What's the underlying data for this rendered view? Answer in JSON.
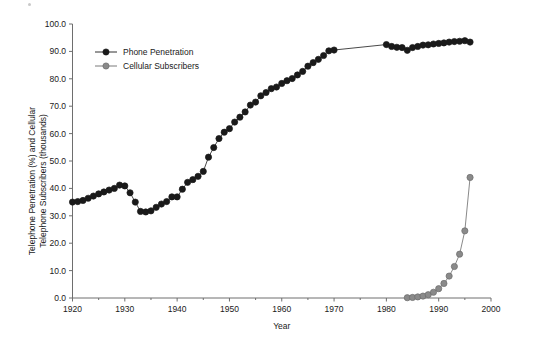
{
  "figure": {
    "background": "#ffffff",
    "axis_color": "#6e6e6e",
    "text_color": "#1a1a1a"
  },
  "chart_data": {
    "type": "line",
    "title": "",
    "xlabel": "Year",
    "ylabel": "Telephone Penetration (%) and Cellular Telephone Subscribers (thousands)",
    "ylabel_line1": "Telephone Penetration (%) and Cellular",
    "ylabel_line2": "Telephone Subscribers (thousands)",
    "xlim": [
      1920,
      2000
    ],
    "ylim": [
      0,
      100
    ],
    "x_major_ticks": [
      1920,
      1930,
      1940,
      1950,
      1960,
      1970,
      1980,
      1990,
      2000
    ],
    "x_minor_ticks": [
      1925,
      1935,
      1945,
      1955,
      1965,
      1975,
      1985,
      1995
    ],
    "x_tick_labels": [
      "1920",
      "1930",
      "1940",
      "1950",
      "1960",
      "1970",
      "1980",
      "1990",
      "2000"
    ],
    "y_major_ticks": [
      0,
      10,
      20,
      30,
      40,
      50,
      60,
      70,
      80,
      90,
      100
    ],
    "y_tick_labels": [
      "0.0",
      "10.0",
      "20.0",
      "30.0",
      "40.0",
      "50.0",
      "60.0",
      "70.0",
      "80.0",
      "90.0",
      "100.0"
    ],
    "grid": false,
    "legend_position": "upper-left-inside",
    "marker_shape": "circle",
    "series": [
      {
        "name": "Phone Penetration",
        "label": "Phone Penetration",
        "color": "#1a1a1a",
        "marker_fill": "#1a1a1a",
        "marker_size": 4.2,
        "x": [
          1920,
          1921,
          1922,
          1923,
          1924,
          1925,
          1926,
          1927,
          1928,
          1929,
          1930,
          1931,
          1932,
          1933,
          1934,
          1935,
          1936,
          1937,
          1938,
          1939,
          1940,
          1941,
          1942,
          1943,
          1944,
          1945,
          1946,
          1947,
          1948,
          1949,
          1950,
          1951,
          1952,
          1953,
          1954,
          1955,
          1956,
          1957,
          1958,
          1959,
          1960,
          1961,
          1962,
          1963,
          1964,
          1965,
          1966,
          1967,
          1968,
          1969,
          1970,
          1980,
          1981,
          1982,
          1983,
          1984,
          1985,
          1986,
          1987,
          1988,
          1989,
          1990,
          1991,
          1992,
          1993,
          1994,
          1995,
          1996
        ],
        "y": [
          35.0,
          35.2,
          35.6,
          36.4,
          37.2,
          38.0,
          38.7,
          39.4,
          40.0,
          41.2,
          40.9,
          38.4,
          35.0,
          31.6,
          31.4,
          31.8,
          33.1,
          34.3,
          35.2,
          36.9,
          36.9,
          39.7,
          42.2,
          43.2,
          44.4,
          46.2,
          51.4,
          54.9,
          58.2,
          60.5,
          61.8,
          64.2,
          66.0,
          67.9,
          70.4,
          71.5,
          73.8,
          75.0,
          76.4,
          77.0,
          78.3,
          79.3,
          80.1,
          81.4,
          82.7,
          84.6,
          85.9,
          87.1,
          88.5,
          90.2,
          90.5,
          92.5,
          91.8,
          91.5,
          91.4,
          90.4,
          91.4,
          91.8,
          92.3,
          92.4,
          92.7,
          92.9,
          93.1,
          93.4,
          93.6,
          93.7,
          93.9,
          93.4
        ]
      },
      {
        "name": "Cellular Subscribers",
        "label": "Cellular Subscribers",
        "color": "#6b6b6b",
        "marker_fill": "#8a8a8a",
        "marker_size": 4.2,
        "x": [
          1984,
          1985,
          1986,
          1987,
          1988,
          1989,
          1990,
          1991,
          1992,
          1993,
          1994,
          1995,
          1996
        ],
        "y": [
          0.1,
          0.2,
          0.4,
          0.7,
          1.2,
          2.1,
          3.4,
          5.3,
          8.0,
          11.5,
          16.0,
          24.5,
          44.0
        ]
      }
    ]
  },
  "legend": {
    "entries": [
      {
        "label": "Phone Penetration",
        "color": "#1a1a1a",
        "fill": "#1a1a1a"
      },
      {
        "label": "Cellular Subscribers",
        "color": "#6b6b6b",
        "fill": "#8a8a8a"
      }
    ]
  }
}
